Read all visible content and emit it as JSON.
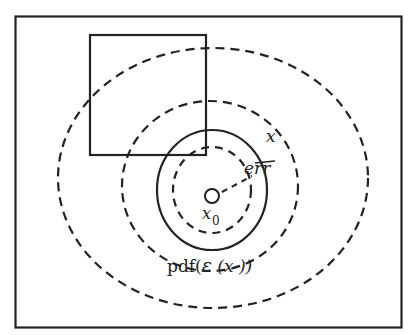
{
  "diagram": {
    "labels": {
      "x": "x",
      "err": "err",
      "x0": "x",
      "x0_subscript": "0",
      "pdf_prefix": "pdf(",
      "pdf_script_e": "ε",
      "pdf_suffix": " (x ))"
    },
    "elements": {
      "frame": "outer rectangle boundary",
      "square": "square region",
      "contours": [
        "inner dashed contour",
        "solid circle",
        "middle dashed contour",
        "outer dashed contour"
      ],
      "center_marker": "small circle at x0"
    },
    "colors": {
      "stroke": "#222222",
      "background": "#ffffff"
    }
  }
}
